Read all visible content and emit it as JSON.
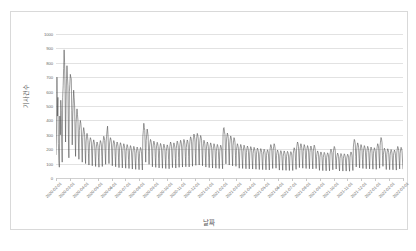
{
  "chart_data": {
    "type": "line",
    "title": "",
    "xlabel": "날짜",
    "ylabel": "기사건수",
    "ylim": [
      0,
      1000
    ],
    "ytick_labels": [
      "1000",
      "900",
      "800",
      "700",
      "600",
      "500",
      "400",
      "300",
      "200",
      "100",
      "0"
    ],
    "ytick_values": [
      1000,
      900,
      800,
      700,
      600,
      500,
      400,
      300,
      200,
      100,
      0
    ],
    "grid": true,
    "legend": "none",
    "xtick_labels": [
      "2020-02-01",
      "2020-03-01",
      "2020-04-01",
      "2020-05-01",
      "2020-06-01",
      "2020-07-01",
      "2020-08-01",
      "2020-09-01",
      "2020-10-01",
      "2020-11-01",
      "2020-12-01",
      "2021-01-01",
      "2021-02-01",
      "2021-03-01",
      "2021-04-01",
      "2021-05-01",
      "2021-06-01",
      "2021-07-01",
      "2021-08-01",
      "2021-09-01",
      "2021-10-01",
      "2021-11-01",
      "2021-12-01",
      "2022-01-01",
      "2022-02-01",
      "2022-03-01"
    ],
    "series": [
      {
        "name": "기사건수",
        "color": "#4a4a4a",
        "values": [
          160,
          300,
          700,
          430,
          560,
          240,
          120,
          75,
          430,
          300,
          540,
          470,
          250,
          110,
          560,
          640,
          760,
          890,
          800,
          620,
          250,
          520,
          690,
          780,
          700,
          640,
          300,
          140,
          600,
          650,
          720,
          700,
          690,
          470,
          230,
          430,
          520,
          610,
          560,
          500,
          300,
          150,
          380,
          430,
          480,
          440,
          400,
          250,
          130,
          330,
          370,
          400,
          380,
          340,
          210,
          110,
          280,
          320,
          350,
          330,
          300,
          190,
          100,
          250,
          290,
          310,
          290,
          260,
          170,
          90,
          230,
          260,
          280,
          270,
          250,
          160,
          85,
          215,
          245,
          265,
          250,
          230,
          150,
          80,
          200,
          230,
          250,
          240,
          220,
          140,
          75,
          210,
          240,
          260,
          250,
          230,
          150,
          80,
          230,
          260,
          290,
          280,
          260,
          170,
          95,
          250,
          290,
          330,
          360,
          300,
          190,
          100,
          230,
          260,
          280,
          270,
          250,
          160,
          85,
          210,
          240,
          260,
          250,
          230,
          150,
          78,
          200,
          230,
          250,
          240,
          220,
          140,
          72,
          195,
          225,
          245,
          235,
          215,
          138,
          70,
          190,
          218,
          238,
          228,
          208,
          132,
          68,
          185,
          212,
          232,
          222,
          202,
          128,
          66,
          180,
          205,
          225,
          215,
          195,
          125,
          62,
          175,
          200,
          220,
          210,
          190,
          120,
          60,
          172,
          196,
          215,
          205,
          186,
          118,
          58,
          170,
          194,
          212,
          202,
          183,
          116,
          56,
          290,
          330,
          380,
          350,
          330,
          210,
          110,
          260,
          300,
          340,
          320,
          290,
          185,
          95,
          215,
          248,
          268,
          258,
          236,
          150,
          78,
          205,
          236,
          256,
          246,
          224,
          142,
          74,
          198,
          228,
          248,
          238,
          218,
          138,
          70,
          192,
          220,
          240,
          230,
          210,
          134,
          68,
          188,
          215,
          235,
          225,
          205,
          130,
          66,
          184,
          210,
          230,
          220,
          200,
          128,
          64,
          200,
          230,
          250,
          240,
          220,
          140,
          72,
          196,
          224,
          244,
          234,
          214,
          136,
          69,
          205,
          236,
          256,
          246,
          224,
          142,
          74,
          210,
          240,
          262,
          252,
          230,
          146,
          76,
          215,
          246,
          268,
          258,
          236,
          150,
          78,
          212,
          242,
          264,
          254,
          232,
          148,
          77,
          230,
          264,
          286,
          276,
          252,
          160,
          82,
          245,
          282,
          305,
          294,
          268,
          170,
          88,
          250,
          286,
          310,
          298,
          272,
          173,
          90,
          238,
          272,
          295,
          284,
          260,
          165,
          85,
          210,
          240,
          262,
          252,
          230,
          146,
          76,
          200,
          230,
          250,
          240,
          220,
          140,
          72,
          195,
          224,
          244,
          234,
          214,
          136,
          69,
          190,
          218,
          238,
          228,
          208,
          132,
          68,
          186,
          214,
          233,
          223,
          203,
          129,
          66,
          182,
          209,
          228,
          218,
          199,
          126,
          64,
          300,
          345,
          350,
          320,
          300,
          190,
          98,
          250,
          288,
          312,
          300,
          274,
          174,
          90,
          235,
          270,
          292,
          282,
          258,
          164,
          84,
          225,
          258,
          280,
          270,
          247,
          157,
          81,
          190,
          218,
          238,
          228,
          208,
          132,
          68,
          186,
          214,
          233,
          223,
          203,
          129,
          66,
          182,
          209,
          228,
          218,
          199,
          126,
          64,
          178,
          204,
          222,
          213,
          194,
          123,
          63,
          174,
          200,
          218,
          209,
          190,
          121,
          62,
          170,
          195,
          213,
          204,
          186,
          118,
          61,
          166,
          191,
          208,
          199,
          182,
          115,
          59,
          163,
          187,
          204,
          195,
          178,
          113,
          58,
          160,
          184,
          200,
          192,
          175,
          111,
          57,
          157,
          180,
          196,
          188,
          171,
          109,
          56,
          185,
          212,
          232,
          222,
          202,
          128,
          66,
          190,
          218,
          238,
          228,
          208,
          132,
          68,
          155,
          178,
          194,
          186,
          169,
          108,
          55,
          152,
          175,
          190,
          182,
          166,
          105,
          54,
          150,
          172,
          188,
          180,
          164,
          104,
          53,
          148,
          170,
          185,
          177,
          161,
          102,
          52,
          146,
          168,
          183,
          175,
          159,
          101,
          52,
          168,
          193,
          210,
          201,
          183,
          116,
          60,
          200,
          230,
          250,
          240,
          220,
          140,
          72,
          190,
          218,
          238,
          228,
          208,
          132,
          68,
          185,
          212,
          232,
          222,
          202,
          128,
          66,
          180,
          206,
          225,
          215,
          196,
          124,
          64,
          178,
          204,
          222,
          213,
          194,
          123,
          63,
          182,
          209,
          228,
          218,
          199,
          126,
          65,
          150,
          172,
          188,
          180,
          164,
          104,
          53,
          145,
          166,
          181,
          173,
          158,
          100,
          51,
          142,
          163,
          178,
          170,
          155,
          98,
          50,
          140,
          161,
          175,
          168,
          153,
          97,
          50,
          160,
          184,
          200,
          192,
          175,
          111,
          57,
          175,
          201,
          219,
          210,
          191,
          121,
          62,
          138,
          158,
          173,
          165,
          150,
          95,
          49,
          136,
          156,
          170,
          163,
          148,
          94,
          48,
          134,
          154,
          168,
          161,
          146,
          93,
          48,
          132,
          152,
          165,
          158,
          144,
          91,
          47,
          145,
          166,
          181,
          173,
          158,
          100,
          52,
          215,
          247,
          268,
          258,
          235,
          149,
          77,
          195,
          224,
          244,
          234,
          214,
          136,
          70,
          185,
          212,
          232,
          222,
          202,
          128,
          66,
          180,
          207,
          225,
          216,
          197,
          125,
          64,
          176,
          202,
          220,
          211,
          192,
          122,
          63,
          172,
          198,
          215,
          206,
          188,
          119,
          61,
          168,
          193,
          210,
          201,
          183,
          116,
          60,
          190,
          218,
          238,
          228,
          208,
          132,
          68,
          225,
          258,
          281,
          270,
          246,
          156,
          81,
          165,
          190,
          207,
          198,
          180,
          114,
          59,
          162,
          186,
          203,
          194,
          177,
          112,
          58,
          158,
          182,
          198,
          190,
          173,
          110,
          57,
          155,
          178,
          194,
          186,
          169,
          107,
          55,
          175,
          201,
          219,
          210,
          191,
          121,
          63,
          170,
          196,
          213,
          204,
          186,
          118,
          61
        ]
      }
    ]
  }
}
